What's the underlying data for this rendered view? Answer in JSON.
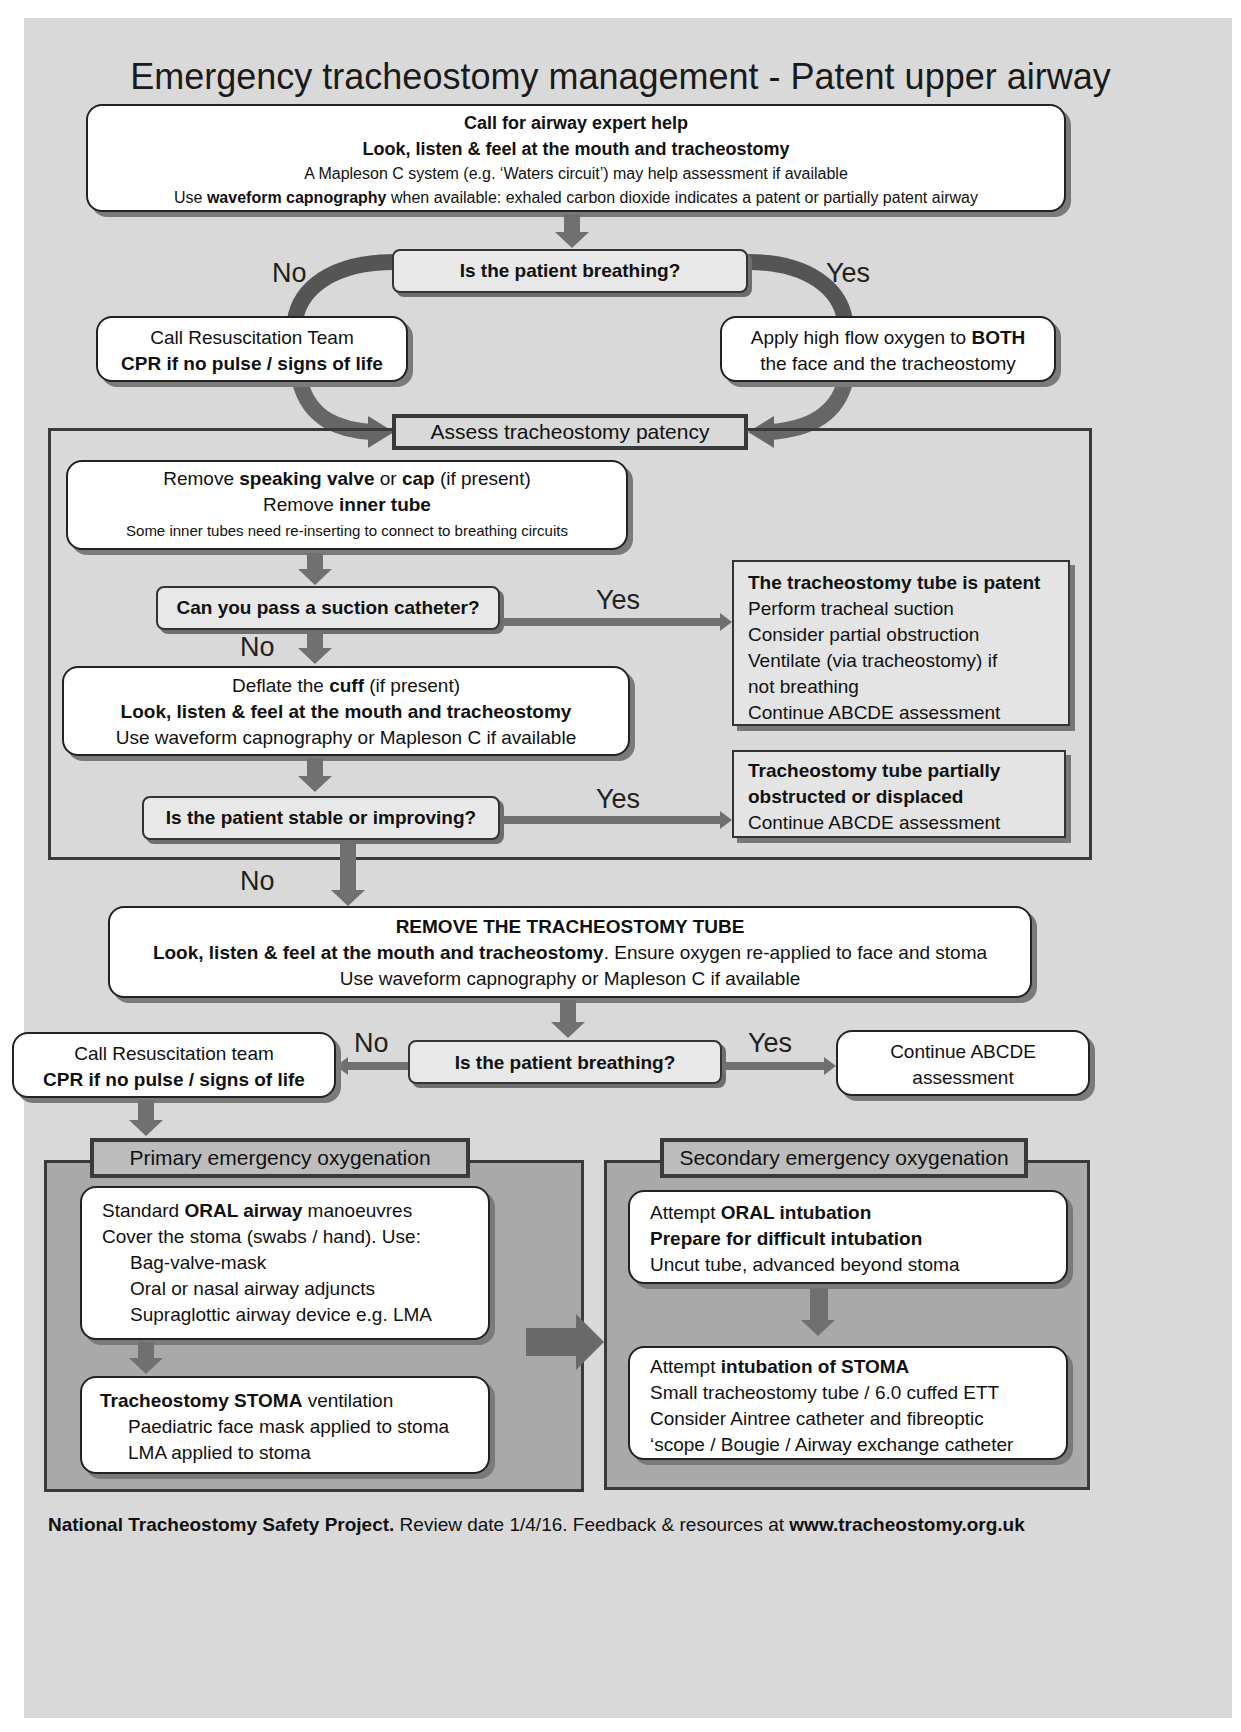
{
  "title": "Emergency tracheostomy management - Patent upper airway",
  "top_box": {
    "line1": "Call for airway expert help",
    "line2": "Look, listen & feel at the mouth and tracheostomy",
    "line3": "A Mapleson C system (e.g. ‘Waters circuit’) may help assessment if available",
    "line4_pre": "Use ",
    "line4_bold": "waveform capnography",
    "line4_post": " when available:  exhaled carbon dioxide indicates a patent or partially patent airway"
  },
  "q1": {
    "text": "Is the patient breathing?",
    "no": "No",
    "yes": "Yes"
  },
  "no_box_1": {
    "line1": "Call Resuscitation Team",
    "line2": "CPR if no pulse / signs of life"
  },
  "yes_box_1": {
    "line1_pre": "Apply high flow oxygen to ",
    "line1_bold": "BOTH",
    "line2": "the face and the tracheostomy"
  },
  "assess_section": {
    "label": "Assess tracheostomy patency",
    "remove_box": {
      "l1_a": "Remove ",
      "l1_b": "speaking valve",
      "l1_c": " or ",
      "l1_d": "cap",
      "l1_e": " (if present)",
      "l2_a": "Remove ",
      "l2_b": "inner tube",
      "l3": "Some inner tubes need re-inserting to connect to breathing circuits"
    },
    "q_suction": {
      "text": "Can you pass a suction catheter?",
      "yes": "Yes",
      "no": "No"
    },
    "patent_box": {
      "heading": "The tracheostomy tube is patent",
      "lines": [
        "Perform tracheal suction",
        "Consider partial obstruction",
        "Ventilate (via tracheostomy) if",
        "not breathing",
        "Continue ABCDE assessment"
      ]
    },
    "deflate_box": {
      "l1_a": "Deflate the ",
      "l1_b": "cuff",
      "l1_c": " (if present)",
      "l2": "Look, listen & feel at the mouth and tracheostomy",
      "l3": "Use waveform capnography or Mapleson C if available"
    },
    "q_stable": {
      "text": "Is the patient stable or improving?",
      "yes": "Yes",
      "no": "No"
    },
    "partial_box": {
      "heading1": "Tracheostomy tube partially",
      "heading2": "obstructed or displaced",
      "line": "Continue ABCDE assessment"
    }
  },
  "remove_tube_box": {
    "l1": "REMOVE THE TRACHEOSTOMY TUBE",
    "l2_bold": "Look, listen & feel at the mouth and tracheostomy",
    "l2_rest": ". Ensure oxygen re-applied to face and stoma",
    "l3": "Use waveform capnography or Mapleson C if available"
  },
  "q2": {
    "text": "Is the patient breathing?",
    "no": "No",
    "yes": "Yes"
  },
  "no_box_2": {
    "line1": "Call Resuscitation team",
    "line2": "CPR if no pulse / signs of life"
  },
  "yes_box_2": {
    "line1": "Continue ABCDE",
    "line2": "assessment"
  },
  "primary": {
    "label": "Primary emergency oxygenation",
    "box1": {
      "l1_a": "Standard ",
      "l1_b": "ORAL airway",
      "l1_c": " manoeuvres",
      "l2": "Cover the stoma (swabs / hand). Use:",
      "items": [
        "Bag-valve-mask",
        "Oral or nasal airway adjuncts",
        "Supraglottic airway device e.g. LMA"
      ]
    },
    "box2": {
      "l1_b": "Tracheostomy STOMA",
      "l1_c": " ventilation",
      "items": [
        "Paediatric face mask applied to stoma",
        "LMA applied to stoma"
      ]
    }
  },
  "secondary": {
    "label": "Secondary emergency oxygenation",
    "box1": {
      "l1_a": "Attempt ",
      "l1_b": "ORAL intubation",
      "l2": "Prepare for difficult intubation",
      "l3": "Uncut tube, advanced beyond stoma"
    },
    "box2": {
      "l1_a": "Attempt ",
      "l1_b": "intubation of STOMA",
      "lines": [
        "Small tracheostomy tube / 6.0 cuffed ETT",
        "Consider Aintree catheter and fibreoptic",
        "‘scope / Bougie / Airway exchange catheter"
      ]
    }
  },
  "footer": {
    "org": "National Tracheostomy Safety Project.",
    "mid": " Review date 1/4/16. Feedback & resources at ",
    "url": "www.tracheostomy.org.uk"
  },
  "colors": {
    "background": "#d9d9d9",
    "arrow": "#707070",
    "frame": "#3a3a3a",
    "section_fill": "#a9a9a9"
  }
}
